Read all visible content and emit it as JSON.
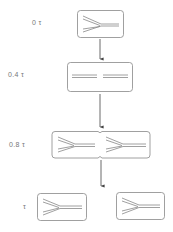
{
  "diagram": {
    "stages": [
      {
        "label": "0 τ",
        "content": "one Y-shaped molecule"
      },
      {
        "label": "0.4 τ",
        "content": "two parallel double lines"
      },
      {
        "label": "0.8 τ",
        "content": "two Y-shaped molecules in notched box"
      },
      {
        "label": "τ",
        "content": "two separate boxes each with Y-shaped molecule"
      }
    ],
    "line_color": "#888888"
  }
}
